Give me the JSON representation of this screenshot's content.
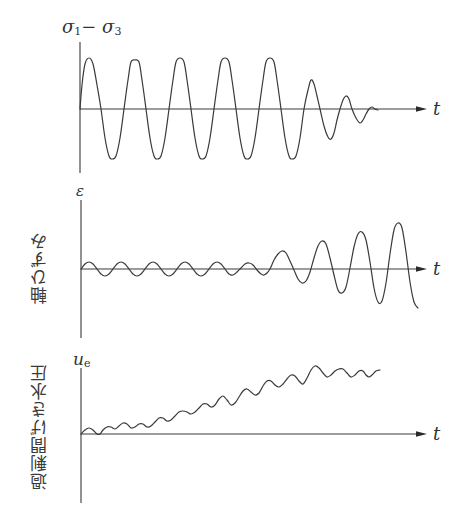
{
  "panels": [
    {
      "id": "deviator-stress",
      "y_label": "σ",
      "y_label_full": "σ1 − σ3",
      "y_label_parts": [
        "σ",
        "1",
        "− σ",
        "3"
      ],
      "x_label": "t",
      "side_label": "",
      "axis": {
        "x0": 80,
        "y_top": 42,
        "y_bottom": 173,
        "baseline": 109,
        "x_end": 427
      },
      "curve_points": [
        [
          80,
          109
        ],
        [
          82,
          85
        ],
        [
          85,
          64
        ],
        [
          89,
          58
        ],
        [
          93,
          64
        ],
        [
          97,
          85
        ],
        [
          101,
          109
        ],
        [
          105,
          138
        ],
        [
          109,
          156
        ],
        [
          112,
          159
        ],
        [
          116,
          156
        ],
        [
          120,
          138
        ],
        [
          124,
          109
        ],
        [
          128,
          80
        ],
        [
          131,
          62
        ],
        [
          135,
          60
        ],
        [
          139,
          62
        ],
        [
          142,
          80
        ],
        [
          146,
          109
        ],
        [
          150,
          138
        ],
        [
          154,
          156
        ],
        [
          157,
          159
        ],
        [
          161,
          156
        ],
        [
          165,
          138
        ],
        [
          169,
          109
        ],
        [
          173,
          80
        ],
        [
          176,
          62
        ],
        [
          180,
          58
        ],
        [
          184,
          62
        ],
        [
          187,
          80
        ],
        [
          191,
          109
        ],
        [
          195,
          138
        ],
        [
          199,
          156
        ],
        [
          202,
          159
        ],
        [
          206,
          156
        ],
        [
          210,
          138
        ],
        [
          214,
          109
        ],
        [
          218,
          80
        ],
        [
          221,
          62
        ],
        [
          225,
          58
        ],
        [
          229,
          62
        ],
        [
          232,
          80
        ],
        [
          236,
          109
        ],
        [
          240,
          138
        ],
        [
          244,
          156
        ],
        [
          247,
          159
        ],
        [
          251,
          156
        ],
        [
          255,
          138
        ],
        [
          259,
          109
        ],
        [
          263,
          80
        ],
        [
          266,
          62
        ],
        [
          270,
          58
        ],
        [
          274,
          62
        ],
        [
          277,
          80
        ],
        [
          281,
          109
        ],
        [
          285,
          138
        ],
        [
          289,
          156
        ],
        [
          292,
          159
        ],
        [
          296,
          156
        ],
        [
          300,
          138
        ],
        [
          304,
          109
        ],
        [
          308,
          90
        ],
        [
          311,
          80
        ],
        [
          314,
          84
        ],
        [
          317,
          96
        ],
        [
          320,
          109
        ],
        [
          324,
          126
        ],
        [
          328,
          137
        ],
        [
          331,
          139
        ],
        [
          334,
          133
        ],
        [
          337,
          120
        ],
        [
          340,
          109
        ],
        [
          343,
          100
        ],
        [
          346,
          96
        ],
        [
          349,
          99
        ],
        [
          352,
          109
        ],
        [
          356,
          118
        ],
        [
          360,
          123
        ],
        [
          363,
          120
        ],
        [
          366,
          114
        ],
        [
          369,
          109
        ],
        [
          372,
          107
        ],
        [
          375,
          109
        ],
        [
          378,
          110
        ]
      ]
    },
    {
      "id": "axial-strain",
      "y_label": "ε",
      "x_label": "t",
      "side_label": "軸ひずみ",
      "axis": {
        "x0": 81,
        "y_top": 200,
        "y_bottom": 338,
        "baseline": 269,
        "x_end": 427
      },
      "curve_points": [
        [
          81,
          269
        ],
        [
          85,
          264
        ],
        [
          89,
          262
        ],
        [
          93,
          264
        ],
        [
          97,
          269
        ],
        [
          101,
          274
        ],
        [
          105,
          276
        ],
        [
          109,
          274
        ],
        [
          113,
          269
        ],
        [
          117,
          264
        ],
        [
          121,
          262
        ],
        [
          125,
          264
        ],
        [
          129,
          269
        ],
        [
          133,
          274
        ],
        [
          137,
          276
        ],
        [
          141,
          274
        ],
        [
          145,
          269
        ],
        [
          149,
          264
        ],
        [
          153,
          262
        ],
        [
          157,
          264
        ],
        [
          161,
          269
        ],
        [
          165,
          274
        ],
        [
          169,
          276
        ],
        [
          173,
          274
        ],
        [
          177,
          269
        ],
        [
          181,
          264
        ],
        [
          185,
          262
        ],
        [
          189,
          264
        ],
        [
          193,
          269
        ],
        [
          197,
          274
        ],
        [
          201,
          276
        ],
        [
          205,
          274
        ],
        [
          209,
          269
        ],
        [
          213,
          264
        ],
        [
          217,
          262
        ],
        [
          221,
          264
        ],
        [
          225,
          269
        ],
        [
          229,
          274
        ],
        [
          233,
          275
        ],
        [
          237,
          272
        ],
        [
          241,
          268
        ],
        [
          245,
          264
        ],
        [
          249,
          263
        ],
        [
          253,
          265
        ],
        [
          257,
          270
        ],
        [
          261,
          274
        ],
        [
          264,
          275
        ],
        [
          267,
          273
        ],
        [
          270,
          269
        ],
        [
          274,
          260
        ],
        [
          278,
          254
        ],
        [
          282,
          251
        ],
        [
          286,
          253
        ],
        [
          290,
          261
        ],
        [
          294,
          270
        ],
        [
          298,
          279
        ],
        [
          302,
          283
        ],
        [
          306,
          281
        ],
        [
          310,
          272
        ],
        [
          314,
          258
        ],
        [
          318,
          246
        ],
        [
          322,
          241
        ],
        [
          326,
          244
        ],
        [
          330,
          258
        ],
        [
          334,
          275
        ],
        [
          338,
          290
        ],
        [
          342,
          293
        ],
        [
          346,
          287
        ],
        [
          350,
          268
        ],
        [
          354,
          247
        ],
        [
          358,
          234
        ],
        [
          362,
          232
        ],
        [
          366,
          240
        ],
        [
          370,
          262
        ],
        [
          374,
          288
        ],
        [
          378,
          302
        ],
        [
          382,
          301
        ],
        [
          386,
          283
        ],
        [
          390,
          254
        ],
        [
          394,
          230
        ],
        [
          398,
          223
        ],
        [
          402,
          228
        ],
        [
          406,
          252
        ],
        [
          410,
          282
        ],
        [
          414,
          302
        ],
        [
          418,
          308
        ]
      ]
    },
    {
      "id": "excess-pore-pressure",
      "y_label": "u",
      "y_label_sub": "e",
      "x_label": "t",
      "side_label": "過剰間げき水圧",
      "axis": {
        "x0": 81,
        "y_top": 368,
        "y_bottom": 503,
        "baseline": 434,
        "x_end": 427
      },
      "curve_points": [
        [
          81,
          434
        ],
        [
          85,
          430
        ],
        [
          89,
          428
        ],
        [
          93,
          430
        ],
        [
          97,
          434
        ],
        [
          100,
          434
        ],
        [
          103,
          430
        ],
        [
          107,
          427
        ],
        [
          111,
          427
        ],
        [
          115,
          429
        ],
        [
          119,
          426
        ],
        [
          123,
          423
        ],
        [
          127,
          424
        ],
        [
          131,
          428
        ],
        [
          135,
          427
        ],
        [
          139,
          424
        ],
        [
          143,
          424
        ],
        [
          147,
          427
        ],
        [
          151,
          426
        ],
        [
          155,
          422
        ],
        [
          159,
          418
        ],
        [
          163,
          418
        ],
        [
          167,
          421
        ],
        [
          171,
          420
        ],
        [
          175,
          416
        ],
        [
          179,
          412
        ],
        [
          183,
          411
        ],
        [
          187,
          412
        ],
        [
          191,
          414
        ],
        [
          195,
          412
        ],
        [
          199,
          408
        ],
        [
          203,
          404
        ],
        [
          207,
          404
        ],
        [
          211,
          407
        ],
        [
          215,
          405
        ],
        [
          219,
          399
        ],
        [
          223,
          396
        ],
        [
          227,
          400
        ],
        [
          231,
          405
        ],
        [
          235,
          403
        ],
        [
          239,
          397
        ],
        [
          243,
          391
        ],
        [
          247,
          389
        ],
        [
          251,
          392
        ],
        [
          255,
          395
        ],
        [
          259,
          393
        ],
        [
          263,
          386
        ],
        [
          267,
          381
        ],
        [
          271,
          381
        ],
        [
          275,
          385
        ],
        [
          279,
          387
        ],
        [
          283,
          384
        ],
        [
          287,
          379
        ],
        [
          291,
          375
        ],
        [
          295,
          376
        ],
        [
          299,
          381
        ],
        [
          303,
          384
        ],
        [
          307,
          378
        ],
        [
          311,
          370
        ],
        [
          315,
          366
        ],
        [
          319,
          368
        ],
        [
          323,
          373
        ],
        [
          327,
          377
        ],
        [
          331,
          375
        ],
        [
          335,
          371
        ],
        [
          339,
          369
        ],
        [
          343,
          369
        ],
        [
          347,
          373
        ],
        [
          351,
          377
        ],
        [
          355,
          375
        ],
        [
          359,
          371
        ],
        [
          363,
          371
        ],
        [
          366,
          375
        ],
        [
          369,
          377
        ],
        [
          372,
          375
        ],
        [
          376,
          371
        ],
        [
          380,
          370
        ]
      ]
    }
  ],
  "chart_data": {
    "type": "line",
    "title": "",
    "series": [
      {
        "name": "σ1 − σ3",
        "side_label": "",
        "behavior": "constant-amplitude sinusoid for ~7 cycles, then rapidly damped oscillation",
        "cycles_constant": 7,
        "amplitude_relative": 1.0
      },
      {
        "name": "ε",
        "side_label": "軸ひずみ",
        "behavior": "small-amplitude oscillation for ~7 cycles, then growing-amplitude oscillation",
        "amplitude_relative_initial": 0.14,
        "amplitude_relative_final": 0.9
      },
      {
        "name": "u_e",
        "side_label": "過剰間げき水圧",
        "behavior": "oscillation superimposed on steadily increasing trend",
        "trend": "increasing"
      }
    ],
    "xlabel": "t",
    "grid": false,
    "legend": "none"
  }
}
